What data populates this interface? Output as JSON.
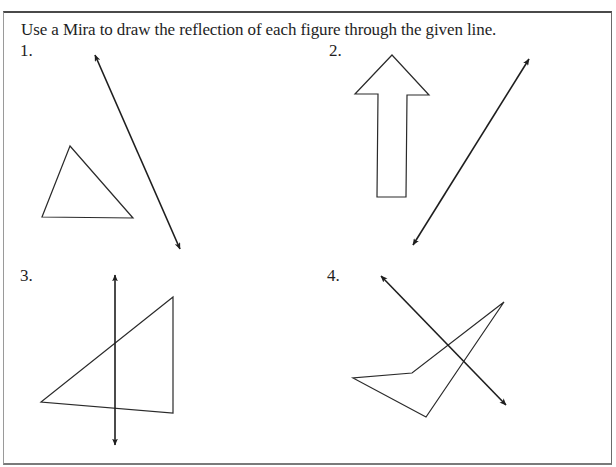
{
  "worksheet": {
    "instructions": "Use a Mira to draw the reflection of each figure through the given line.",
    "problems": [
      {
        "label": "1.",
        "figure": "triangle",
        "figure_points": [
          [
            70,
            146
          ],
          [
            42,
            217
          ],
          [
            133,
            218
          ]
        ],
        "reflection_line": {
          "from": [
            94,
            53
          ],
          "to": [
            181,
            251
          ]
        }
      },
      {
        "label": "2.",
        "figure": "arrow",
        "figure_points": [
          [
            392,
            55
          ],
          [
            429,
            95
          ],
          [
            407,
            95
          ],
          [
            406,
            197
          ],
          [
            377,
            197
          ],
          [
            378,
            94
          ],
          [
            355,
            94
          ]
        ],
        "reflection_line": {
          "from": [
            412,
            247
          ],
          "to": [
            530,
            57
          ]
        }
      },
      {
        "label": "3.",
        "figure": "triangle",
        "figure_points": [
          [
            173,
            297
          ],
          [
            41,
            402
          ],
          [
            173,
            413
          ]
        ],
        "reflection_line": {
          "from": [
            115,
            273
          ],
          "to": [
            115,
            447
          ]
        }
      },
      {
        "label": "4.",
        "figure": "quadrilateral",
        "figure_points": [
          [
            504,
            302
          ],
          [
            412,
            373
          ],
          [
            353,
            378
          ],
          [
            426,
            417
          ]
        ],
        "reflection_line": {
          "from": [
            380,
            275
          ],
          "to": [
            507,
            407
          ]
        }
      }
    ],
    "colors": {
      "ink": "#1e1e1e",
      "paper": "#ffffff"
    }
  }
}
